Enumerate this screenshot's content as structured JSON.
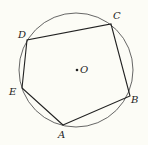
{
  "diagram": {
    "type": "inscribed-pentagon",
    "background": "#fcfcf6",
    "stroke_color": "#222222",
    "circle": {
      "center": {
        "x": 76,
        "y": 70
      },
      "radius": 57,
      "center_label": "O"
    },
    "vertices": [
      {
        "name": "A",
        "x": 63,
        "y": 125,
        "label_x": 58,
        "label_y": 138
      },
      {
        "name": "B",
        "x": 130,
        "y": 96,
        "label_x": 131,
        "label_y": 103
      },
      {
        "name": "C",
        "x": 111,
        "y": 24,
        "label_x": 113,
        "label_y": 19
      },
      {
        "name": "D",
        "x": 27,
        "y": 40,
        "label_x": 18,
        "label_y": 38
      },
      {
        "name": "E",
        "x": 22,
        "y": 88,
        "label_x": 9,
        "label_y": 95
      }
    ],
    "labels": {
      "A": "A",
      "B": "B",
      "C": "C",
      "D": "D",
      "E": "E",
      "O": "O"
    }
  }
}
